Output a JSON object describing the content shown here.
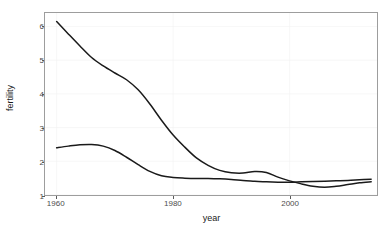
{
  "chart_data": {
    "type": "line",
    "title": "",
    "xlabel": "year",
    "ylabel": "fertility",
    "xlim": [
      1958,
      2015
    ],
    "ylim": [
      1,
      6.4
    ],
    "xticks": [
      1960,
      1980,
      2000
    ],
    "yticks": [
      1,
      2,
      3,
      4,
      5,
      6
    ],
    "grid": false,
    "legend": "none",
    "line_color": "#1a1a1a",
    "panel_border_color": "#9d9d9d",
    "x": [
      1960,
      1962,
      1964,
      1966,
      1968,
      1970,
      1972,
      1974,
      1976,
      1978,
      1980,
      1982,
      1984,
      1986,
      1988,
      1990,
      1992,
      1994,
      1996,
      1998,
      2000,
      2002,
      2004,
      2006,
      2008,
      2010,
      2012,
      2014
    ],
    "series": [
      {
        "name": "series-upper",
        "values": [
          6.15,
          5.78,
          5.42,
          5.08,
          4.83,
          4.62,
          4.42,
          4.12,
          3.7,
          3.22,
          2.78,
          2.42,
          2.1,
          1.88,
          1.73,
          1.66,
          1.65,
          1.7,
          1.67,
          1.53,
          1.42,
          1.33,
          1.26,
          1.23,
          1.26,
          1.31,
          1.36,
          1.39
        ]
      },
      {
        "name": "series-lower",
        "values": [
          2.4,
          2.45,
          2.49,
          2.5,
          2.45,
          2.32,
          2.12,
          1.9,
          1.7,
          1.57,
          1.52,
          1.5,
          1.49,
          1.49,
          1.48,
          1.46,
          1.43,
          1.41,
          1.39,
          1.38,
          1.38,
          1.39,
          1.4,
          1.41,
          1.42,
          1.43,
          1.45,
          1.47
        ]
      }
    ]
  },
  "axes": {
    "y_title": "fertility",
    "x_title": "year",
    "y_tick_labels": [
      "1",
      "2",
      "3",
      "4",
      "5",
      "6"
    ],
    "x_tick_labels": [
      "1960",
      "1980",
      "2000"
    ]
  }
}
